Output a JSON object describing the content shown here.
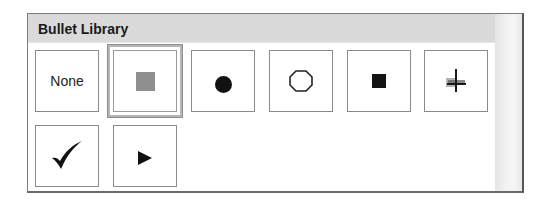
{
  "panel": {
    "title": "Bullet Library"
  },
  "bullets": [
    {
      "id": "none",
      "label": "None",
      "icon": "none-text",
      "selected": false
    },
    {
      "id": "gray-square",
      "label": "",
      "icon": "gray-square-icon",
      "selected": true
    },
    {
      "id": "filled-circle",
      "label": "",
      "icon": "filled-circle-icon",
      "selected": false
    },
    {
      "id": "hollow-octagon",
      "label": "",
      "icon": "hollow-octagon-icon",
      "selected": false
    },
    {
      "id": "black-square",
      "label": "",
      "icon": "black-square-icon",
      "selected": false
    },
    {
      "id": "cross-star",
      "label": "",
      "icon": "cross-star-icon",
      "selected": false
    },
    {
      "id": "checkmark",
      "label": "",
      "icon": "checkmark-icon",
      "selected": false
    },
    {
      "id": "arrowhead",
      "label": "",
      "icon": "arrowhead-right-icon",
      "selected": false
    }
  ],
  "colors": {
    "header_bg": "#dadada",
    "tile_border": "#8a8a8a",
    "selected_square": "#8f8f8f",
    "glyph": "#111111"
  }
}
